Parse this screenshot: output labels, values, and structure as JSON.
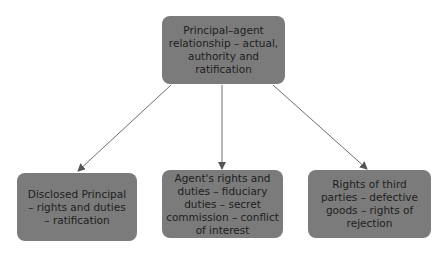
{
  "diagram": {
    "type": "tree",
    "colors": {
      "node_fill": "#7b7b7b",
      "node_text": "#1e1e1e",
      "edge": "#6e6e6e",
      "background": "#ffffff"
    },
    "root": {
      "id": "principal-agent",
      "label": "Principal–agent relationship – actual, authority and ratification"
    },
    "children": [
      {
        "id": "disclosed-principal",
        "label": "Disclosed Principal – rights and duties – ratification"
      },
      {
        "id": "agents-rights",
        "label": "Agent's rights and duties – fiduciary duties – secret commission – conflict of interest"
      },
      {
        "id": "third-parties",
        "label": "Rights of third parties – defective goods – rights of rejection"
      }
    ],
    "edges": [
      {
        "from": "principal-agent",
        "to": "disclosed-principal"
      },
      {
        "from": "principal-agent",
        "to": "agents-rights"
      },
      {
        "from": "principal-agent",
        "to": "third-parties"
      }
    ]
  }
}
